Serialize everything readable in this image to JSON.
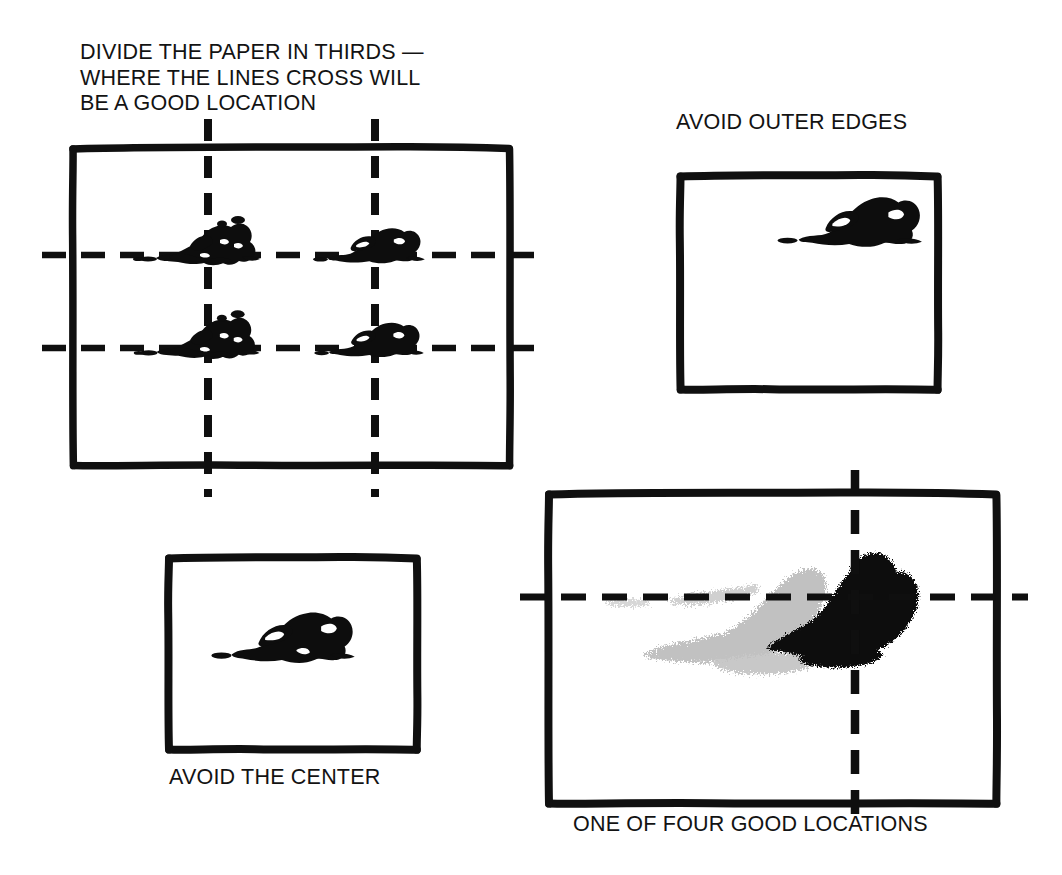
{
  "page": {
    "background_color": "#ffffff",
    "ink_color": "#0d0d0d",
    "wash_color": "#b0b0b0",
    "width": 1062,
    "height": 875
  },
  "panels": [
    {
      "id": "thirds",
      "caption": "DIVIDE THE PAPER IN THIRDS —\nWHERE THE LINES CROSS WILL\nBE A GOOD LOCATION",
      "caption_position": "above",
      "frame": {
        "x": 72,
        "y": 147,
        "w": 438,
        "h": 318
      },
      "grid": {
        "vertical_lines": [
          208,
          375
        ],
        "horizontal_lines": [
          255,
          348
        ],
        "dash_length": 22,
        "dash_gap": 14,
        "overshoot": 30
      },
      "subjects": [
        {
          "x": 208,
          "y": 248,
          "scale": 1.0,
          "tone": "dark"
        },
        {
          "x": 375,
          "y": 248,
          "scale": 0.92,
          "tone": "dark"
        },
        {
          "x": 208,
          "y": 342,
          "scale": 0.98,
          "tone": "dark"
        },
        {
          "x": 375,
          "y": 342,
          "scale": 0.9,
          "tone": "dark"
        }
      ]
    },
    {
      "id": "outer-edges",
      "caption": "AVOID OUTER EDGES",
      "caption_position": "above",
      "frame": {
        "x": 680,
        "y": 175,
        "w": 257,
        "h": 213
      },
      "grid": null,
      "subjects": [
        {
          "x": 857,
          "y": 226,
          "scale": 1.05,
          "tone": "dark"
        }
      ]
    },
    {
      "id": "center",
      "caption": "AVOID THE CENTER",
      "caption_position": "below",
      "frame": {
        "x": 168,
        "y": 557,
        "w": 248,
        "h": 192
      },
      "grid": null,
      "subjects": [
        {
          "x": 292,
          "y": 641,
          "scale": 1.0,
          "tone": "dark"
        }
      ]
    },
    {
      "id": "good-location",
      "caption": "ONE OF FOUR GOOD LOCATIONS",
      "caption_position": "below",
      "frame": {
        "x": 548,
        "y": 493,
        "w": 447,
        "h": 310
      },
      "grid": {
        "vertical_lines": [
          855
        ],
        "horizontal_lines": [
          597
        ],
        "dash_length": 24,
        "dash_gap": 15,
        "overshoot": 30
      },
      "subjects": [
        {
          "x": 855,
          "y": 620,
          "scale": 2.3,
          "tone": "dark"
        },
        {
          "x": 735,
          "y": 625,
          "scale": 2.2,
          "tone": "light"
        }
      ]
    }
  ],
  "captions": {
    "thirds": "DIVIDE THE PAPER IN THIRDS —\nWHERE THE LINES CROSS WILL\nBE A GOOD LOCATION",
    "outer_edges": "AVOID OUTER EDGES",
    "center": "AVOID THE CENTER",
    "good_location": "ONE OF FOUR GOOD LOCATIONS"
  }
}
